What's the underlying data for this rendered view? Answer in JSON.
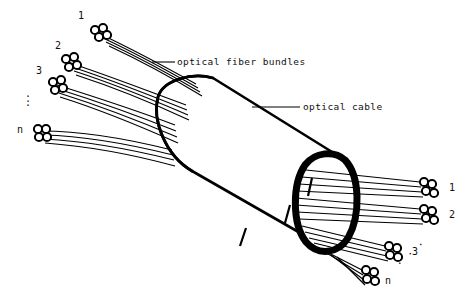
{
  "figure": {
    "background_color": "#ffffff",
    "ink_color": "#000000"
  },
  "annotations": {
    "fiber_bundles_label": "optical fiber bundles",
    "cable_label": "optical cable"
  },
  "input_side": {
    "position": "left",
    "bundle_labels": [
      "1",
      "2",
      "3",
      "n"
    ],
    "ellipsis": ".\n.\n.",
    "ellipsis_style": "vertical"
  },
  "output_side": {
    "position": "right",
    "bundle_labels": [
      "1",
      "2",
      "3",
      "n"
    ],
    "ellipsis": ". . .",
    "ellipsis_style": "diagonal"
  },
  "geometry": {
    "fibers_per_bundle": 4,
    "input_bundle_count": 4,
    "output_bundle_count": 4,
    "cable_orientation": "diagonal-down-right"
  }
}
